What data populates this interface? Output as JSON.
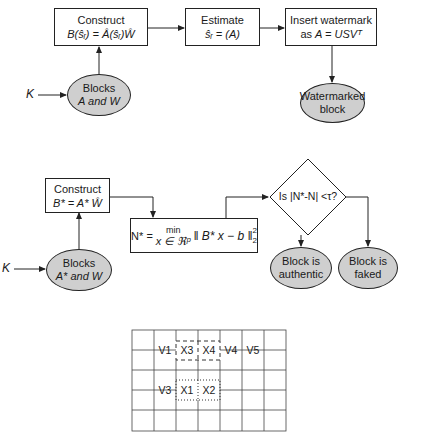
{
  "top_flow": {
    "construct": {
      "title": "Construct",
      "formula": "B(ŝᵣ) = Â(ŝᵣ)Ŵ"
    },
    "estimate": {
      "title": "Estimate",
      "formula": "ŝᵣ = (A)"
    },
    "insert": {
      "title": "Insert watermark",
      "formula_prefix": "as ",
      "formula": "A = USVᵀ"
    },
    "blocks": {
      "line1": "Blocks",
      "line2": "A and W"
    },
    "key": "K",
    "output": {
      "line1": "Watermarked",
      "line2": "block"
    }
  },
  "middle_flow": {
    "construct": {
      "title": "Construct",
      "formula": "B* = A* Ŵ"
    },
    "norm": {
      "lhs": "N* =",
      "min": "min",
      "sub": "x ∈ ℜᵖ",
      "expr": "‖ B* x − b ‖",
      "sup": "2",
      "subn": "2"
    },
    "decision": "Is |N*-N| <τ?",
    "blocks": {
      "line1": "Blocks",
      "line2": "A* and W"
    },
    "key": "K",
    "authentic": {
      "line1": "Block is",
      "line2": "authentic"
    },
    "faked": {
      "line1": "Block is",
      "line2": "faked"
    }
  },
  "grid": {
    "columns": 7,
    "rows": 5,
    "cells": [
      {
        "label": "V1",
        "row": 1,
        "col": 1
      },
      {
        "label": "X3",
        "row": 1,
        "col": 2
      },
      {
        "label": "X4",
        "row": 1,
        "col": 3
      },
      {
        "label": "V4",
        "row": 1,
        "col": 4
      },
      {
        "label": "V5",
        "row": 1,
        "col": 5
      },
      {
        "label": "V3",
        "row": 3,
        "col": 1
      },
      {
        "label": "X1",
        "row": 3,
        "col": 2
      },
      {
        "label": "X2",
        "row": 3,
        "col": 3
      }
    ]
  },
  "colors": {
    "ellipse_fill": "#cfcfcf",
    "line": "#222222"
  }
}
